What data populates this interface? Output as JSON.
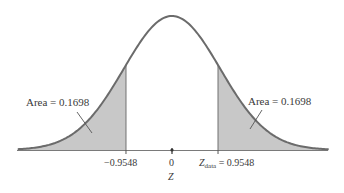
{
  "chart_data": {
    "type": "area",
    "title": "",
    "xlabel": "Z",
    "ylabel": "",
    "distribution": "standard normal",
    "x_range": [
      -3.2,
      3.25
    ],
    "ticks": [
      {
        "value": -0.9548,
        "label": "−0.9548"
      },
      {
        "value": 0,
        "label": "0"
      },
      {
        "value": 0.9548,
        "label_main": "Z",
        "label_sub": "data",
        "label_rest": " = 0.9548"
      }
    ],
    "shaded_regions": [
      {
        "from": -3.2,
        "to": -0.9548,
        "area": 0.1698,
        "label": "Area = 0.1698"
      },
      {
        "from": 0.9548,
        "to": 3.25,
        "area": 0.1698,
        "label": "Area = 0.1698"
      }
    ],
    "grid": false,
    "legend": "none"
  },
  "labels": {
    "left_area": "Area = 0.1698",
    "right_area": "Area = 0.1698",
    "tick_neg": "−0.9548",
    "tick_zero": "0",
    "tick_pos_main": "Z",
    "tick_pos_sub": "data",
    "tick_pos_rest": " = 0.9548",
    "x_axis_label": "Z"
  },
  "colors": {
    "curve": "#6b6b6b",
    "shade": "#c8c8c8",
    "axis": "#7a7a7a",
    "text": "#3a3a3a"
  }
}
